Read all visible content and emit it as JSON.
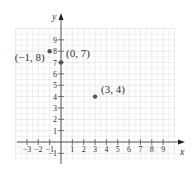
{
  "chart_data": {
    "type": "scatter",
    "title": "",
    "xlabel": "x",
    "ylabel": "y",
    "xlim": [
      -4,
      10
    ],
    "ylim": [
      -1.5,
      10
    ],
    "grid": true,
    "legend": null,
    "x_ticks": [
      -3,
      -2,
      -1,
      1,
      2,
      3,
      4,
      5,
      6,
      7,
      8,
      9
    ],
    "x_tick_labels": [
      "−3",
      "−2",
      "−1",
      "1",
      "2",
      "3",
      "4",
      "5",
      "6",
      "7",
      "8",
      "9"
    ],
    "y_ticks": [
      -1,
      1,
      2,
      3,
      4,
      5,
      6,
      7,
      8,
      9
    ],
    "y_tick_labels": [
      "−1",
      "1",
      "2",
      "3",
      "4",
      "5",
      "6",
      "7",
      "8",
      "9"
    ],
    "points": [
      {
        "x": -1,
        "y": 8,
        "label": "(−1, 8)"
      },
      {
        "x": 0,
        "y": 7,
        "label": "(0, 7)"
      },
      {
        "x": 3,
        "y": 4,
        "label": "(3, 4)"
      }
    ]
  },
  "style": {
    "axis_color": "#555555",
    "grid_color": "#e4e4e4",
    "point_color": "#555555",
    "text_color": "#333333"
  }
}
